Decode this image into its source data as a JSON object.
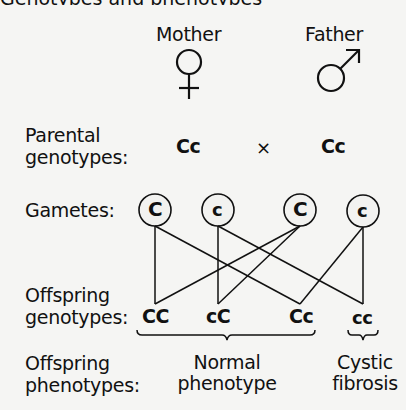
{
  "top_cut_text": "Genotypes and phenotypes (cystic fibrosis)",
  "parents": {
    "mother": {
      "label": "Mother",
      "symbol": "female-symbol"
    },
    "father": {
      "label": "Father",
      "symbol": "male-symbol"
    }
  },
  "rows": {
    "parental_genotypes": {
      "label_line1": "Parental",
      "label_line2": "genotypes:",
      "mother": "Cc",
      "cross": "×",
      "father": "Cc"
    },
    "gametes": {
      "label": "Gametes:",
      "items": [
        "C",
        "c",
        "C",
        "c"
      ]
    },
    "offspring_genotypes": {
      "label_line1": "Offspring",
      "label_line2": "genotypes:",
      "items": [
        "CC",
        "cC",
        "Cc",
        "cc"
      ]
    },
    "offspring_phenotypes": {
      "label_line1": "Offspring",
      "label_line2": "phenotypes:",
      "groups": [
        {
          "line1": "Normal",
          "line2": "phenotype"
        },
        {
          "line1": "Cystic",
          "line2": "fibrosis"
        }
      ]
    }
  },
  "colors": {
    "background": "#f5f5f3",
    "ink": "#111111"
  }
}
